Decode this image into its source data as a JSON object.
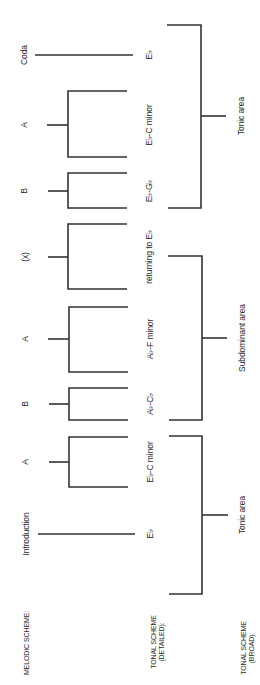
{
  "diagram": {
    "title_fragment": "",
    "row_headers": {
      "melodic": "MELODIC SCHEME:",
      "tonal_detailed_line1": "TONAL SCHEME",
      "tonal_detailed_line2": "(DETAILED):",
      "tonal_broad_line1": "TONAL SCHEME",
      "tonal_broad_line2": "(BROAD):"
    },
    "melodic_sections": [
      {
        "label": "Introduction"
      },
      {
        "label": "A"
      },
      {
        "label": "B"
      },
      {
        "label": "A"
      },
      {
        "label": "(x)"
      },
      {
        "label": "B"
      },
      {
        "label": "A"
      },
      {
        "label": "Coda"
      }
    ],
    "tonal_detailed": [
      {
        "label": "E♭"
      },
      {
        "label": "E♭-C minor"
      },
      {
        "label": "A♭-C♭"
      },
      {
        "label": "A♭-F minor"
      },
      {
        "label": "returning to E♭"
      },
      {
        "label": "E♭-G♭"
      },
      {
        "label": "E♭-C minor"
      },
      {
        "label": "E♭"
      }
    ],
    "tonal_broad": [
      {
        "label": "Tonic area"
      },
      {
        "label": "Subdominant area"
      },
      {
        "label": "Tonic area"
      }
    ],
    "line_color": "#333333"
  }
}
